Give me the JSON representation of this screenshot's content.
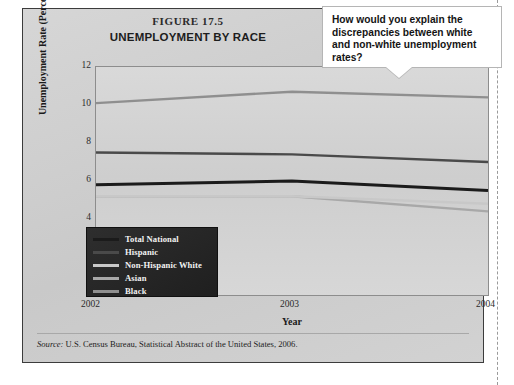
{
  "figure": {
    "number": "FIGURE 17.5",
    "title": "UNEMPLOYMENT BY RACE"
  },
  "callout": {
    "text": "How would you explain the discrepancies between white and non-white unemployment rates?"
  },
  "source": {
    "prefix": "Source:",
    "text": "U.S. Census Bureau, Statistical Abstract of the United States, 2006."
  },
  "legend": {
    "items": [
      {
        "label": "Total National",
        "color": "#1b1b1b"
      },
      {
        "label": "Hispanic",
        "color": "#4a4a4a"
      },
      {
        "label": "Non-Hispanic White",
        "color": "#c8c8c8"
      },
      {
        "label": "Asian",
        "color": "#a8a8a8"
      },
      {
        "label": "Black",
        "color": "#8f8f8f"
      }
    ]
  },
  "chart_data": {
    "type": "line",
    "title": "UNEMPLOYMENT BY RACE",
    "xlabel": "Year",
    "ylabel": "Unemployment Rate (Percentage)",
    "categories": [
      "2002",
      "2003",
      "2004"
    ],
    "x": [
      2002,
      2003,
      2004
    ],
    "xlim": [
      2002,
      2004
    ],
    "ylim": [
      0,
      12
    ],
    "yticks": [
      2,
      4,
      6,
      8,
      10,
      12
    ],
    "xticks": [
      "2002",
      "2003",
      "2004"
    ],
    "grid": false,
    "legend_position": "inside-lower-left",
    "series": [
      {
        "name": "Total National",
        "color": "#1b1b1b",
        "values": [
          5.8,
          6.0,
          5.5
        ]
      },
      {
        "name": "Hispanic",
        "color": "#4a4a4a",
        "values": [
          7.5,
          7.4,
          7.0
        ]
      },
      {
        "name": "Non-Hispanic White",
        "color": "#c8c8c8",
        "values": [
          5.2,
          5.2,
          4.8
        ]
      },
      {
        "name": "Asian",
        "color": "#a8a8a8",
        "values": [
          5.2,
          5.2,
          4.4
        ]
      },
      {
        "name": "Black",
        "color": "#8f8f8f",
        "values": [
          10.1,
          10.7,
          10.4
        ]
      }
    ]
  }
}
